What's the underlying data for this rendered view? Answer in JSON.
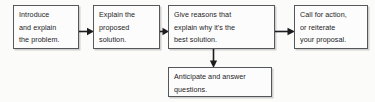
{
  "diagram": {
    "type": "horizontal-process-flowchart",
    "background_color": "#fbfbfa",
    "node_fill_color": "#fcfcfc",
    "node_border_color": "#55585a",
    "shadow_color": "#cfcfcf",
    "text_color": "#1d1d1f",
    "nodes": [
      {
        "id": "node-1",
        "order": 1,
        "text": "Introduce\nand explain\nthe problem.",
        "lines": [
          "Introduce",
          "and explain",
          "the problem."
        ]
      },
      {
        "id": "node-2",
        "order": 2,
        "text": "Explain the\nproposed\nsolution.",
        "lines": [
          "Explain the",
          "proposed",
          "solution."
        ]
      },
      {
        "id": "node-3",
        "order": 3,
        "text": "Give reasons that\nexplain why it's the\nbest solution.",
        "lines": [
          "Give reasons that",
          "explain why it's the",
          "best solution."
        ]
      },
      {
        "id": "node-4",
        "order": 4,
        "text": "Call for action,\nor reiterate\nyour proposal.",
        "lines": [
          "Call for action,",
          "or reiterate",
          "your proposal."
        ]
      },
      {
        "id": "node-5",
        "order": 5,
        "text": "Anticipate and answer\nquestions.",
        "lines": [
          "Anticipate and answer",
          "questions."
        ]
      }
    ],
    "connectors": [
      {
        "id": "arrow-1",
        "from": "node-1",
        "to": "node-2",
        "direction": "right"
      },
      {
        "id": "arrow-2",
        "from": "node-2",
        "to": "node-3",
        "direction": "right"
      },
      {
        "id": "arrow-3",
        "from": "node-3",
        "to": "node-4",
        "direction": "right"
      },
      {
        "id": "arrow-4",
        "from": "node-3",
        "to": "node-5",
        "direction": "down"
      }
    ]
  }
}
